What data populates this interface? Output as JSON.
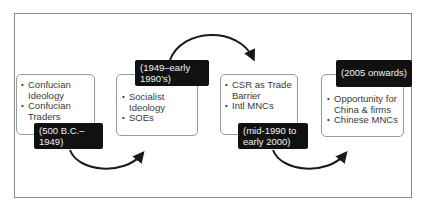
{
  "stages": [
    {
      "period": "(500 B.C.–\n1949)",
      "items": [
        "Confucian Ideology",
        "Confucian Traders"
      ]
    },
    {
      "period": "(1949–early\n1990’s)",
      "items": [
        "Socialist Ideology",
        "SOEs"
      ]
    },
    {
      "period": "(mid-1990 to\nearly 2000)",
      "items": [
        "CSR as Trade Barrier",
        "Intl MNCs"
      ]
    },
    {
      "period": "(2005 onwards)",
      "items": [
        "Opportunity for China & firms",
        "Chinese MNCs"
      ]
    }
  ],
  "arrows": [
    {
      "from": 1,
      "to": 2,
      "direction": "down-curve"
    },
    {
      "from": 2,
      "to": 3,
      "direction": "up-curve"
    },
    {
      "from": 3,
      "to": 4,
      "direction": "down-curve"
    }
  ]
}
